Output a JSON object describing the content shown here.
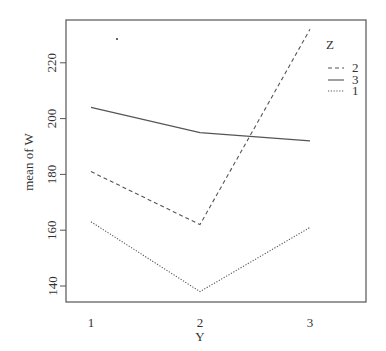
{
  "chart_data": {
    "type": "line",
    "title": "",
    "xlabel": "Y",
    "ylabel": "mean of W",
    "categories": [
      "1",
      "2",
      "3"
    ],
    "y_ticks": [
      140,
      160,
      180,
      200,
      220
    ],
    "ylim": [
      134,
      235
    ],
    "grid": false,
    "legend": {
      "title": "Z",
      "position": "right-inside-top",
      "entries": [
        {
          "label": "2",
          "style": "dashed"
        },
        {
          "label": "3",
          "style": "solid"
        },
        {
          "label": "1",
          "style": "dotted"
        }
      ]
    },
    "series": [
      {
        "name": "2",
        "style": "dashed",
        "values": [
          181,
          162,
          232
        ]
      },
      {
        "name": "3",
        "style": "solid",
        "values": [
          204,
          195,
          192
        ]
      },
      {
        "name": "1",
        "style": "dotted",
        "values": [
          163,
          138,
          161
        ]
      }
    ]
  },
  "layout": {
    "plot": {
      "left": 66,
      "top": 20,
      "right": 366,
      "bottom": 302
    },
    "x_positions": [
      91,
      200,
      310
    ],
    "y_ref": {
      "value": 140,
      "pixel": 286,
      "px_per_unit": 2.79
    },
    "line_color": "#555555"
  }
}
